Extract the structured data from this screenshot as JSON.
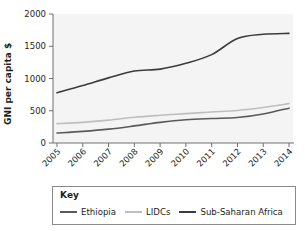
{
  "chart_data": {
    "type": "line",
    "title": "",
    "xlabel": "",
    "ylabel": "GNI per capita $",
    "categories": [
      "2005",
      "2006",
      "2007",
      "2008",
      "2009",
      "2010",
      "2011",
      "2012",
      "2013",
      "2014"
    ],
    "x": [
      2005,
      2006,
      2007,
      2008,
      2009,
      2010,
      2011,
      2012,
      2013,
      2014
    ],
    "ylim": [
      0,
      2000
    ],
    "yticks": [
      0,
      500,
      1000,
      1500,
      2000
    ],
    "ytick_labels": [
      "0",
      "500",
      "1000",
      "1500",
      "2000"
    ],
    "grid": false,
    "legend_position": "bottom",
    "series": [
      {
        "name": "Ethiopia",
        "color": "#58595b",
        "values": [
          155,
          180,
          215,
          265,
          320,
          360,
          380,
          395,
          450,
          540
        ]
      },
      {
        "name": "LIDCs",
        "color": "#bcbec0",
        "values": [
          300,
          320,
          355,
          400,
          430,
          455,
          480,
          505,
          550,
          610
        ]
      },
      {
        "name": "Sub-Saharan Africa",
        "color": "#3c3c3c",
        "values": [
          780,
          890,
          1010,
          1115,
          1145,
          1235,
          1370,
          1620,
          1685,
          1700
        ]
      }
    ]
  },
  "axis": {
    "y_title": "GNI per capita $"
  },
  "legend": {
    "title": "Key",
    "items": [
      {
        "label": "Ethiopia",
        "color": "#58595b"
      },
      {
        "label": "LIDCs",
        "color": "#bcbec0"
      },
      {
        "label": "Sub-Saharan Africa",
        "color": "#3c3c3c"
      }
    ]
  }
}
